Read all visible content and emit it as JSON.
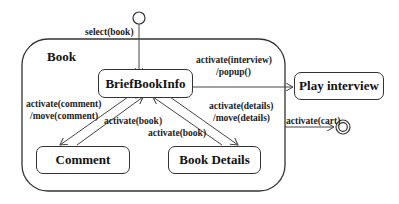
{
  "diagram": {
    "type": "UML state machine",
    "composite_state": {
      "name": "Book"
    },
    "states": [
      {
        "id": "brief",
        "name": "BriefBookInfo"
      },
      {
        "id": "comment",
        "name": "Comment"
      },
      {
        "id": "details",
        "name": "Book Details"
      },
      {
        "id": "play",
        "name": "Play interview"
      }
    ],
    "pseudostates": [
      "initial",
      "final"
    ],
    "transitions": [
      {
        "from": "initial",
        "to": "brief",
        "label": "select(book)"
      },
      {
        "from": "brief",
        "to": "play",
        "label_line1": "activate(interview)",
        "label_line2": "/popup()"
      },
      {
        "from": "brief",
        "to": "comment",
        "label_line1": "activate(comment)",
        "label_line2": "/move(comment)"
      },
      {
        "from": "comment",
        "to": "brief",
        "label": "activate(book)"
      },
      {
        "from": "details",
        "to": "brief",
        "label": "activate(book)"
      },
      {
        "from": "brief",
        "to": "details",
        "label_line1": "activate(details)",
        "label_line2": "/move(details)"
      },
      {
        "from": "Book",
        "to": "final",
        "label": "activate(cart)"
      }
    ]
  }
}
